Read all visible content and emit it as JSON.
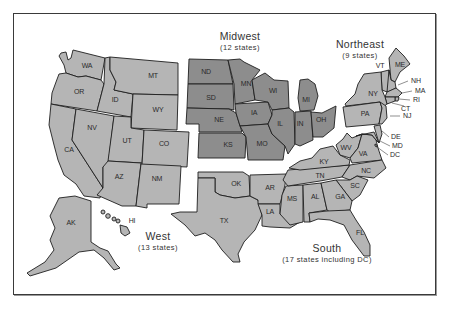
{
  "map": {
    "title": "U.S. Census Regions",
    "colors": {
      "midwest": "#8d8d8d",
      "other_regions": "#b5b5b5",
      "border": "#1e1e1e",
      "background": "#ffffff"
    },
    "regions": {
      "west": {
        "name": "West",
        "count": "(13 states)"
      },
      "midwest": {
        "name": "Midwest",
        "count": "(12 states)"
      },
      "northeast": {
        "name": "Northeast",
        "count": "(9 states)"
      },
      "south": {
        "name": "South",
        "count": "(17 states including DC)"
      }
    },
    "states": {
      "WA": "WA",
      "OR": "OR",
      "CA": "CA",
      "ID": "ID",
      "NV": "NV",
      "MT": "MT",
      "WY": "WY",
      "UT": "UT",
      "CO": "CO",
      "AZ": "AZ",
      "NM": "NM",
      "AK": "AK",
      "HI": "HI",
      "ND": "ND",
      "SD": "SD",
      "NE": "NE",
      "KS": "KS",
      "MN": "MN",
      "IA": "IA",
      "MO": "MO",
      "WI": "WI",
      "IL": "IL",
      "IN": "IN",
      "MI": "MI",
      "OH": "OH",
      "ME": "ME",
      "VT": "VT",
      "NH": "NH",
      "MA": "MA",
      "RI": "RI",
      "CT": "CT",
      "NY": "NY",
      "NJ": "NJ",
      "PA": "PA",
      "OK": "OK",
      "TX": "TX",
      "AR": "AR",
      "LA": "LA",
      "MS": "MS",
      "AL": "AL",
      "TN": "TN",
      "KY": "KY",
      "WV": "WV",
      "VA": "VA",
      "NC": "NC",
      "SC": "SC",
      "GA": "GA",
      "FL": "FL",
      "DE": "DE",
      "MD": "MD",
      "DC": "DC"
    }
  }
}
